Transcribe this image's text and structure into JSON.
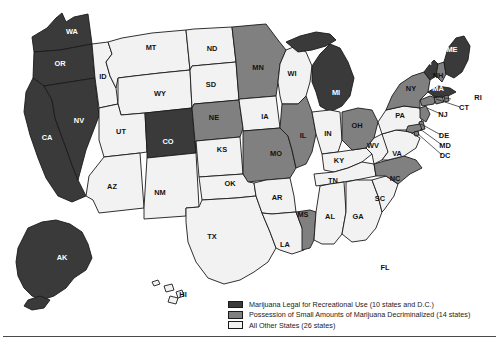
{
  "figure": {
    "type": "choropleth-map"
  },
  "colors": {
    "legal": "#3a3a3a",
    "decriminalized": "#808080",
    "other": "#f2f2f2",
    "outline": "#1a1a1a",
    "label_on_dark": "#ffffff",
    "label_on_light": "#121212",
    "rule": "#4a4a4a"
  },
  "legend": {
    "items": [
      {
        "swatch": "legal",
        "label": "Marijuana Legal for Recreational Use (10 states and D.C.)"
      },
      {
        "swatch": "decriminalized",
        "label": "Possession of Small Amounts of Marijuana Decriminalized (14 states)"
      },
      {
        "swatch": "other",
        "label": "All Other States (26 states)"
      }
    ]
  },
  "chart_data": {
    "type": "map",
    "title": "",
    "categories": [
      "Marijuana Legal for Recreational Use",
      "Possession of Small Amounts of Marijuana Decriminalized",
      "All Other States"
    ],
    "counts": [
      10,
      14,
      26
    ],
    "legal_states": [
      "WA",
      "OR",
      "CA",
      "NV",
      "CO",
      "MI",
      "IL",
      "ME",
      "VT",
      "MA",
      "AK",
      "DC"
    ],
    "decriminalized_states": [
      "MN",
      "NE",
      "MO",
      "OH",
      "MS",
      "NC",
      "NY",
      "NH",
      "CT",
      "RI",
      "NJ",
      "DE",
      "MD"
    ],
    "other_states": [
      "ID",
      "MT",
      "WY",
      "UT",
      "AZ",
      "NM",
      "ND",
      "SD",
      "IA",
      "WI",
      "KS",
      "OK",
      "TX",
      "AR",
      "LA",
      "IN",
      "KY",
      "TN",
      "AL",
      "GA",
      "SC",
      "FL",
      "VA",
      "WV",
      "PA",
      "HI"
    ]
  },
  "states": [
    {
      "id": "WA",
      "label": "WA",
      "status": "legal",
      "lx": 72,
      "ly": 32
    },
    {
      "id": "OR",
      "label": "OR",
      "status": "legal",
      "lx": 60,
      "ly": 64
    },
    {
      "id": "CA",
      "label": "CA",
      "status": "legal",
      "lx": 47,
      "ly": 138
    },
    {
      "id": "NV",
      "label": "NV",
      "status": "legal",
      "lx": 79,
      "ly": 121
    },
    {
      "id": "ID",
      "label": "ID",
      "status": "other",
      "lx": 103,
      "ly": 77
    },
    {
      "id": "MT",
      "label": "MT",
      "status": "other",
      "lx": 151,
      "ly": 48
    },
    {
      "id": "WY",
      "label": "WY",
      "status": "other",
      "lx": 160,
      "ly": 94
    },
    {
      "id": "UT",
      "label": "UT",
      "status": "other",
      "lx": 121,
      "ly": 132
    },
    {
      "id": "AZ",
      "label": "AZ",
      "status": "other",
      "lx": 112,
      "ly": 187
    },
    {
      "id": "CO",
      "label": "CO",
      "status": "legal",
      "lx": 168,
      "ly": 142
    },
    {
      "id": "NM",
      "label": "NM",
      "status": "other",
      "lx": 160,
      "ly": 193
    },
    {
      "id": "ND",
      "label": "ND",
      "status": "other",
      "lx": 212,
      "ly": 49
    },
    {
      "id": "SD",
      "label": "SD",
      "status": "other",
      "lx": 211,
      "ly": 85
    },
    {
      "id": "NE",
      "label": "NE",
      "status": "decriminalized",
      "lx": 214,
      "ly": 118
    },
    {
      "id": "KS",
      "label": "KS",
      "status": "other",
      "lx": 222,
      "ly": 150
    },
    {
      "id": "OK",
      "label": "OK",
      "status": "other",
      "lx": 230,
      "ly": 184
    },
    {
      "id": "TX",
      "label": "TX",
      "status": "other",
      "lx": 212,
      "ly": 237
    },
    {
      "id": "MN",
      "label": "MN",
      "status": "decriminalized",
      "lx": 258,
      "ly": 68
    },
    {
      "id": "IA",
      "label": "IA",
      "status": "other",
      "lx": 265,
      "ly": 117
    },
    {
      "id": "MO",
      "label": "MO",
      "status": "decriminalized",
      "lx": 276,
      "ly": 154
    },
    {
      "id": "AR",
      "label": "AR",
      "status": "other",
      "lx": 277,
      "ly": 198
    },
    {
      "id": "LA",
      "label": "LA",
      "status": "other",
      "lx": 285,
      "ly": 245
    },
    {
      "id": "WI",
      "label": "WI",
      "status": "other",
      "lx": 292,
      "ly": 74
    },
    {
      "id": "IL",
      "label": "IL",
      "status": "decriminalized",
      "lx": 303,
      "ly": 136
    },
    {
      "id": "MS",
      "label": "MS",
      "status": "decriminalized",
      "lx": 303,
      "ly": 215
    },
    {
      "id": "MI",
      "label": "MI",
      "status": "legal",
      "lx": 336,
      "ly": 93
    },
    {
      "id": "IN",
      "label": "IN",
      "status": "other",
      "lx": 328,
      "ly": 134
    },
    {
      "id": "KY",
      "label": "KY",
      "status": "other",
      "lx": 339,
      "ly": 161
    },
    {
      "id": "TN",
      "label": "TN",
      "status": "other",
      "lx": 333,
      "ly": 181
    },
    {
      "id": "AL",
      "label": "AL",
      "status": "other",
      "lx": 330,
      "ly": 217
    },
    {
      "id": "OH",
      "label": "OH",
      "status": "decriminalized",
      "lx": 357,
      "ly": 126
    },
    {
      "id": "GA",
      "label": "GA",
      "status": "other",
      "lx": 358,
      "ly": 217
    },
    {
      "id": "FL",
      "label": "FL",
      "status": "other",
      "lx": 385,
      "ly": 268
    },
    {
      "id": "SC",
      "label": "SC",
      "status": "other",
      "lx": 380,
      "ly": 199
    },
    {
      "id": "NC",
      "label": "NC",
      "status": "decriminalized",
      "lx": 395,
      "ly": 179
    },
    {
      "id": "WV",
      "label": "WV",
      "status": "other",
      "lx": 373,
      "ly": 146
    },
    {
      "id": "VA",
      "label": "VA",
      "status": "other",
      "lx": 397,
      "ly": 154
    },
    {
      "id": "PA",
      "label": "PA",
      "status": "other",
      "lx": 400,
      "ly": 116
    },
    {
      "id": "NY",
      "label": "NY",
      "status": "decriminalized",
      "lx": 411,
      "ly": 89
    },
    {
      "id": "VT",
      "label": "VT",
      "status": "legal",
      "lx": 428,
      "ly": 63
    },
    {
      "id": "NH",
      "label": "NH",
      "status": "decriminalized",
      "lx": 438,
      "ly": 76
    },
    {
      "id": "MA",
      "label": "MA",
      "status": "legal",
      "lx": 438,
      "ly": 89
    },
    {
      "id": "ME",
      "label": "ME",
      "status": "legal",
      "lx": 452,
      "ly": 50
    },
    {
      "id": "AK",
      "label": "AK",
      "status": "legal",
      "lx": 62,
      "ly": 258
    },
    {
      "id": "HI",
      "label": "HI",
      "status": "other",
      "lx": 183,
      "ly": 295
    }
  ],
  "callouts": [
    {
      "id": "RI",
      "label": "RI",
      "lx": 478,
      "ly": 98
    },
    {
      "id": "CT",
      "label": "CT",
      "lx": 464,
      "ly": 108
    },
    {
      "id": "NJ",
      "label": "NJ",
      "lx": 443,
      "ly": 115
    },
    {
      "id": "DE",
      "label": "DE",
      "lx": 444,
      "ly": 136
    },
    {
      "id": "MD",
      "label": "MD",
      "lx": 445,
      "ly": 146
    },
    {
      "id": "DC",
      "label": "DC",
      "lx": 445,
      "ly": 156
    }
  ]
}
